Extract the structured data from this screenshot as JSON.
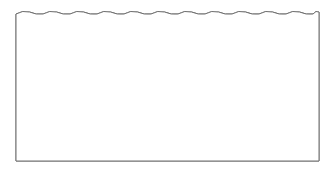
{
  "figure": {
    "frame": {
      "x": 16,
      "y": 14,
      "width": 303,
      "height": 147,
      "stroke": "#707070"
    },
    "scale_radius": 27,
    "colors": {
      "white": "#ffffff",
      "light": "#e8e8e8",
      "medium": "#cfcfcf",
      "dark": "#bcbcbc",
      "outline": "#555555"
    },
    "rows": [
      {
        "cy": 13,
        "scales": [
          {
            "cx": 60,
            "color": "white"
          },
          {
            "cx": 113,
            "color": "dark"
          },
          {
            "cx": 167,
            "color": "dark"
          },
          {
            "cx": 222,
            "color": "light"
          },
          {
            "cx": 276,
            "color": "dark"
          }
        ]
      },
      {
        "cy": 40,
        "scales": [
          {
            "cx": 87,
            "color": "light"
          },
          {
            "cx": 140,
            "color": "white"
          },
          {
            "cx": 195,
            "color": "light"
          },
          {
            "cx": 249,
            "color": "dark"
          }
        ]
      },
      {
        "cy": 66,
        "scales": [
          {
            "cx": 60,
            "color": "medium"
          },
          {
            "cx": 113,
            "color": "light"
          },
          {
            "cx": 167,
            "color": "dark"
          },
          {
            "cx": 222,
            "color": "dark"
          },
          {
            "cx": 276,
            "color": "white"
          }
        ]
      },
      {
        "cy": 90,
        "scales": [
          {
            "cx": 87,
            "color": "dark"
          },
          {
            "cx": 140,
            "color": "white"
          },
          {
            "cx": 195,
            "color": "light"
          },
          {
            "cx": 249,
            "color": "white"
          }
        ]
      }
    ]
  }
}
